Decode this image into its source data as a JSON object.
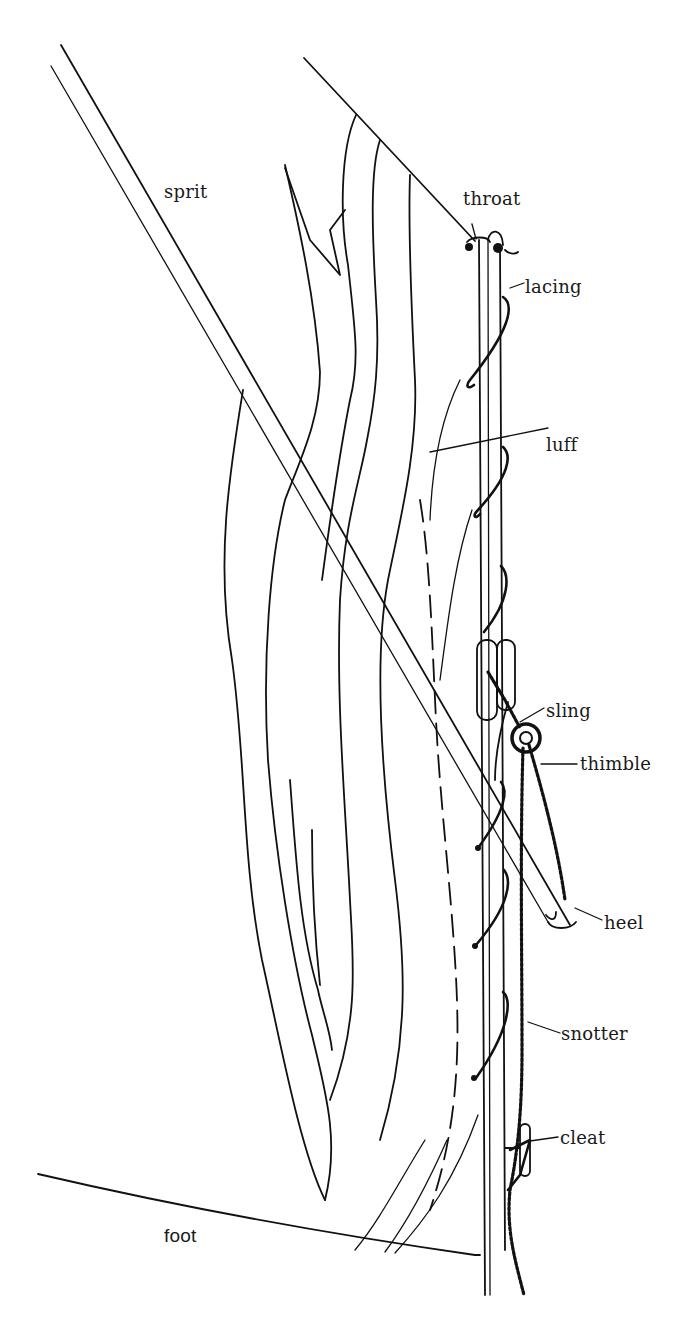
{
  "diagram": {
    "colors": {
      "ink": "#111111",
      "background": "#ffffff"
    },
    "labels": [
      {
        "id": "sprit",
        "text": "sprit",
        "x": 170,
        "y": 185
      },
      {
        "id": "throat",
        "text": "throat",
        "x": 463,
        "y": 192
      },
      {
        "id": "lacing",
        "text": "lacing",
        "x": 526,
        "y": 278
      },
      {
        "id": "luff",
        "text": "luff",
        "x": 546,
        "y": 437
      },
      {
        "id": "sling",
        "text": "sling",
        "x": 546,
        "y": 703
      },
      {
        "id": "thimble",
        "text": "thimble",
        "x": 580,
        "y": 756
      },
      {
        "id": "heel",
        "text": "heel",
        "x": 604,
        "y": 915
      },
      {
        "id": "snotter",
        "text": "snotter",
        "x": 561,
        "y": 1026
      },
      {
        "id": "cleat",
        "text": "cleat",
        "x": 560,
        "y": 1129
      },
      {
        "id": "foot",
        "text": "foot",
        "x": 164,
        "y": 1228
      }
    ],
    "parts": [
      "sprit",
      "mast",
      "sail",
      "head",
      "foot",
      "luff",
      "lacing",
      "throat",
      "sling",
      "thimble",
      "snotter",
      "heel",
      "cleat"
    ]
  }
}
